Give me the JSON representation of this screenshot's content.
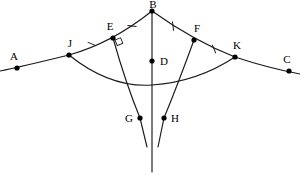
{
  "figure": {
    "type": "geometry-diagram",
    "background_color": "#ffffff",
    "stroke_color": "#1a1a1a",
    "width": 300,
    "height": 175
  },
  "points": [
    {
      "id": "A",
      "label": "A",
      "x": 17,
      "y": 68,
      "label_x": 14,
      "label_y": 60,
      "anchor": "middle"
    },
    {
      "id": "J",
      "label": "J",
      "x": 69,
      "y": 55,
      "label_x": 70,
      "label_y": 47,
      "anchor": "middle"
    },
    {
      "id": "E",
      "label": "E",
      "x": 113,
      "y": 38,
      "label_x": 110,
      "label_y": 30,
      "anchor": "middle"
    },
    {
      "id": "B",
      "label": "B",
      "x": 152,
      "y": 11,
      "label_x": 153,
      "label_y": 8,
      "anchor": "middle"
    },
    {
      "id": "F",
      "label": "F",
      "x": 194,
      "y": 40,
      "label_x": 197,
      "label_y": 32,
      "anchor": "middle"
    },
    {
      "id": "K",
      "label": "K",
      "x": 235,
      "y": 57,
      "label_x": 237,
      "label_y": 49,
      "anchor": "middle"
    },
    {
      "id": "C",
      "label": "C",
      "x": 289,
      "y": 71,
      "label_x": 287,
      "label_y": 63,
      "anchor": "middle"
    },
    {
      "id": "D",
      "label": "D",
      "x": 152,
      "y": 61,
      "label_x": 160,
      "label_y": 65,
      "anchor": "start"
    },
    {
      "id": "G",
      "label": "G",
      "x": 140,
      "y": 118,
      "label_x": 133,
      "label_y": 122,
      "anchor": "end"
    },
    {
      "id": "H",
      "label": "H",
      "x": 164,
      "y": 118,
      "label_x": 171,
      "label_y": 122,
      "anchor": "start"
    }
  ],
  "paths": {
    "upper_arc_AC": "M 0 71 Q 20 67 69 55 Q 112 43 152 11 Q 194 41 235 57 Q 268 68 300 74",
    "lower_arc_JK": "M 69 55 Q 110 88 152 85 Q 197 82 235 57",
    "vertical_BD": "M 152 11 L 152 172",
    "curve_EG": "M 113 38 Q 126 84 140 118 L 147 147",
    "curve_FH": "M 194 40 Q 178 84 164 118 L 158 147"
  },
  "tick_marks": [
    {
      "id": "tick-JE",
      "x": 92,
      "y": 44,
      "angle": -22
    },
    {
      "id": "tick-EB",
      "x": 132,
      "y": 26,
      "angle": -38
    },
    {
      "id": "tick-BF",
      "x": 173,
      "y": 26,
      "angle": 38
    },
    {
      "id": "tick-FK",
      "x": 214,
      "y": 49,
      "angle": 22
    }
  ],
  "right_angle_marker": {
    "id": "right-angle-at-E",
    "x": 115,
    "y": 40,
    "size": 6,
    "rotation": -22
  }
}
